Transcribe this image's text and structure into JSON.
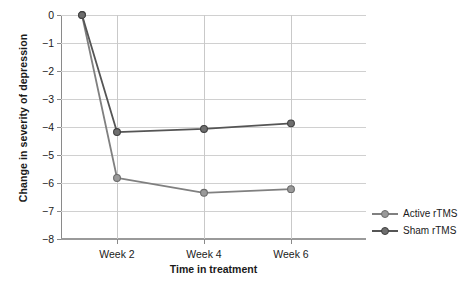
{
  "chart_data": {
    "type": "line",
    "title": "",
    "xlabel": "Time in treatment",
    "ylabel": "Change in severity of depression",
    "x": [
      0,
      1,
      2,
      3
    ],
    "x_positions_px": [
      82,
      117,
      204,
      291
    ],
    "categories": [
      "Baseline",
      "Week 2",
      "Week 4",
      "Week 6"
    ],
    "xtick_labels": [
      "Week 2",
      "Week 4",
      "Week 6"
    ],
    "ytick_labels": [
      "0",
      "−1",
      "−2",
      "−3",
      "−4",
      "−5",
      "−6",
      "−7",
      "−8"
    ],
    "ytick_values": [
      0,
      -1,
      -2,
      -3,
      -4,
      -5,
      -6,
      -7,
      -8
    ],
    "ylim": [
      -8,
      0
    ],
    "grid": "horizontal-and-vertical",
    "legend_position": "right",
    "series": [
      {
        "name": "Active rTMS",
        "color": "#808080",
        "values": [
          0.0,
          -5.82,
          -6.35,
          -6.22
        ],
        "marker": "circle"
      },
      {
        "name": "Sham rTMS",
        "color": "#555555",
        "values": [
          0.0,
          -4.18,
          -4.07,
          -3.87
        ],
        "marker": "circle"
      }
    ]
  },
  "legend": {
    "entries": [
      {
        "label": "Active rTMS",
        "color": "#808080"
      },
      {
        "label": "Sham rTMS",
        "color": "#555555"
      }
    ]
  },
  "colors": {
    "active": "#808080",
    "sham": "#555555",
    "grid": "#d0d0d0",
    "axis": "#8a8a8a",
    "text": "#1a1a1a",
    "background": "#ffffff"
  }
}
